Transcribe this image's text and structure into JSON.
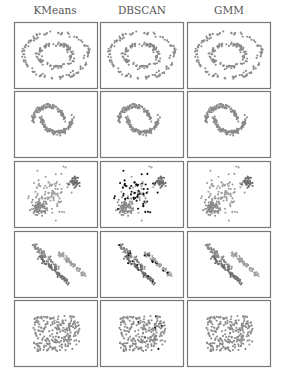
{
  "chart_data": {
    "type": "scatter",
    "title": "",
    "columns": [
      "KMeans",
      "DBSCAN",
      "GMM"
    ],
    "rows": [
      "noisy_circles",
      "noisy_moons",
      "blobs_varied",
      "aniso",
      "no_structure"
    ],
    "colors": {
      "cluster_a": "#8a8a8a",
      "cluster_b": "#6e6e6e",
      "cluster_c": "#a0a0a0",
      "noise": "#111111",
      "frame": "#777777"
    },
    "panels": [
      {
        "row": "noisy_circles",
        "method": "KMeans",
        "clusters": 2,
        "noise": false
      },
      {
        "row": "noisy_circles",
        "method": "DBSCAN",
        "clusters": 2,
        "noise": false
      },
      {
        "row": "noisy_circles",
        "method": "GMM",
        "clusters": 2,
        "noise": false
      },
      {
        "row": "noisy_moons",
        "method": "KMeans",
        "clusters": 2,
        "noise": false
      },
      {
        "row": "noisy_moons",
        "method": "DBSCAN",
        "clusters": 2,
        "noise": false
      },
      {
        "row": "noisy_moons",
        "method": "GMM",
        "clusters": 2,
        "noise": false
      },
      {
        "row": "blobs_varied",
        "method": "KMeans",
        "clusters": 3,
        "noise": false
      },
      {
        "row": "blobs_varied",
        "method": "DBSCAN",
        "clusters": 3,
        "noise": true
      },
      {
        "row": "blobs_varied",
        "method": "GMM",
        "clusters": 3,
        "noise": false
      },
      {
        "row": "aniso",
        "method": "KMeans",
        "clusters": 3,
        "noise": false
      },
      {
        "row": "aniso",
        "method": "DBSCAN",
        "clusters": 3,
        "noise": true
      },
      {
        "row": "aniso",
        "method": "GMM",
        "clusters": 3,
        "noise": false
      },
      {
        "row": "no_structure",
        "method": "KMeans",
        "clusters": 1,
        "noise": false
      },
      {
        "row": "no_structure",
        "method": "DBSCAN",
        "clusters": 1,
        "noise": true
      },
      {
        "row": "no_structure",
        "method": "GMM",
        "clusters": 1,
        "noise": false
      }
    ],
    "axes": "off",
    "grid": false,
    "legend": "none"
  }
}
